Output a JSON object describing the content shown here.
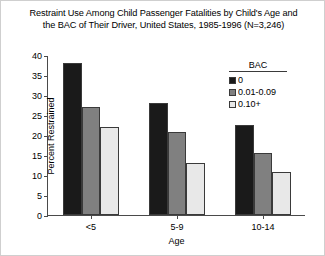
{
  "chart_data": {
    "type": "bar",
    "title": "Restraint Use Among Child Passenger Fatalities by Child's Age and the BAC of Their Driver, United States, 1985-1996 (N=3,246)",
    "title_lines": [
      "Restraint Use Among Child Passenger Fatalities by Child's Age and",
      "the BAC of Their Driver, United States, 1985-1996 (N=3,246)"
    ],
    "xlabel": "Age",
    "ylabel": "Percent Restrained",
    "categories": [
      "<5",
      "5-9",
      "10-14"
    ],
    "ylim": [
      0,
      40
    ],
    "yticks": [
      0,
      5,
      10,
      15,
      20,
      25,
      30,
      35,
      40
    ],
    "ytick_labels": [
      "0",
      "5",
      "10",
      "15",
      "20",
      "25",
      "30",
      "35",
      "40"
    ],
    "grid": false,
    "legend_position": "upper-right",
    "legend_title": "BAC",
    "series": [
      {
        "name": "0",
        "values": [
          38,
          28,
          22.5
        ],
        "color": "#1a1a1a"
      },
      {
        "name": "0.01-0.09",
        "values": [
          27,
          20.7,
          15.5
        ],
        "color": "#808080"
      },
      {
        "name": "0.10+",
        "values": [
          22,
          13,
          10.7
        ],
        "color": "#e8e8e8"
      }
    ]
  }
}
